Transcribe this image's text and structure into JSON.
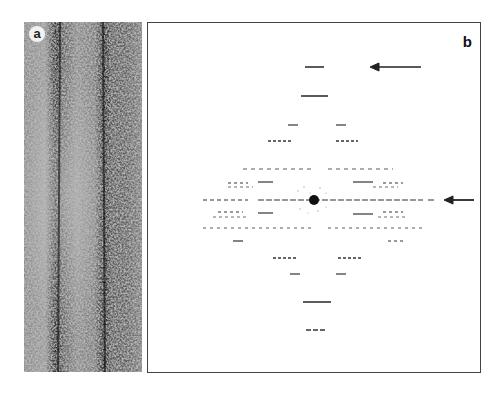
{
  "figure": {
    "panels": [
      {
        "id": "a",
        "label": "a",
        "description": "electron micrograph of filament with parallel dark striations"
      },
      {
        "id": "b",
        "label": "b",
        "description": "diffraction pattern / Fourier transform with layer lines"
      }
    ],
    "annotations": [
      {
        "type": "arrow",
        "panel": "b",
        "direction": "left",
        "position": "top layer line"
      },
      {
        "type": "arrow",
        "panel": "b",
        "direction": "left",
        "position": "equator"
      }
    ]
  }
}
